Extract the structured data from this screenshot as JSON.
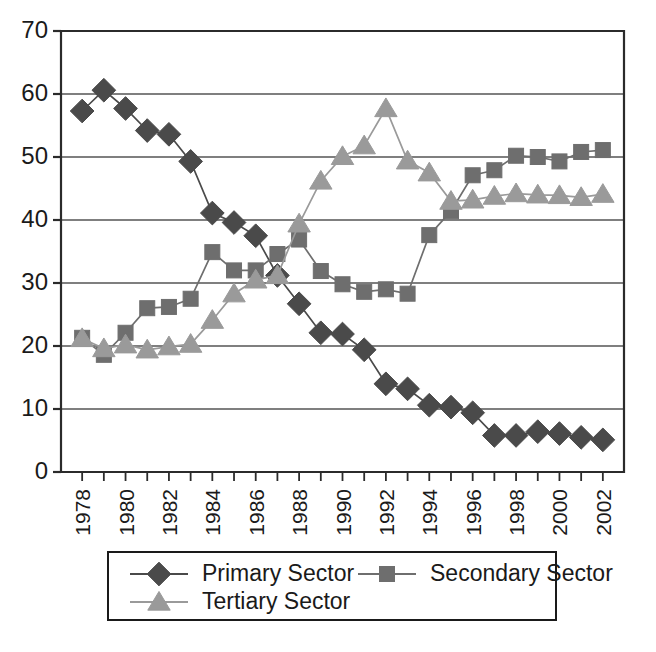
{
  "chart_data": {
    "type": "line",
    "title": "",
    "subtitle": "",
    "xlabel": "",
    "ylabel": "",
    "x": [
      1978,
      1979,
      1980,
      1981,
      1982,
      1983,
      1984,
      1985,
      1986,
      1987,
      1988,
      1989,
      1990,
      1991,
      1992,
      1993,
      1994,
      1995,
      1996,
      1997,
      1998,
      1999,
      2000,
      2001,
      2002
    ],
    "categories": [
      "1978",
      "1979",
      "1980",
      "1981",
      "1982",
      "1983",
      "1984",
      "1985",
      "1986",
      "1987",
      "1988",
      "1989",
      "1990",
      "1991",
      "1992",
      "1993",
      "1994",
      "1995",
      "1996",
      "1997",
      "1998",
      "1999",
      "2000",
      "2001",
      "2002"
    ],
    "xtick_labels": [
      "1978",
      "",
      "1980",
      "",
      "1982",
      "",
      "1984",
      "",
      "1986",
      "",
      "1988",
      "",
      "1990",
      "",
      "1992",
      "",
      "1994",
      "",
      "1996",
      "",
      "1998",
      "",
      "2000",
      "",
      "2002"
    ],
    "ytick_labels": [
      "0",
      "10",
      "20",
      "30",
      "40",
      "50",
      "60",
      "70"
    ],
    "yticks": [
      0,
      10,
      20,
      30,
      40,
      50,
      60,
      70
    ],
    "ylim": [
      0,
      70
    ],
    "xlim": [
      1977.5,
      2002.5
    ],
    "grid": "horizontal",
    "legend_position": "bottom",
    "series": [
      {
        "name": "Primary Sector",
        "marker": "diamond",
        "color": "#4a4a4a",
        "line_color": "#4a4a4a",
        "values": [
          57.3,
          60.6,
          57.7,
          54.2,
          53.6,
          49.3,
          41.1,
          39.6,
          37.5,
          31.2,
          26.7,
          22.1,
          21.9,
          19.4,
          14.0,
          13.2,
          10.6,
          10.3,
          9.4,
          5.8,
          5.8,
          6.4,
          6.1,
          5.5,
          5.1
        ]
      },
      {
        "name": "Secondary Sector",
        "marker": "square",
        "color": "#6e6e6e",
        "line_color": "#6e6e6e",
        "values": [
          21.3,
          18.6,
          22.1,
          26.0,
          26.2,
          27.5,
          34.9,
          32.0,
          32.0,
          34.6,
          36.9,
          31.9,
          29.8,
          28.6,
          29.0,
          28.3,
          37.6,
          41.4,
          47.1,
          47.9,
          50.2,
          50.0,
          49.3,
          50.8,
          51.1
        ]
      },
      {
        "name": "Tertiary Sector",
        "marker": "triangle",
        "color": "#9a9a9a",
        "line_color": "#9a9a9a",
        "values": [
          21.2,
          19.6,
          20.2,
          19.4,
          19.9,
          20.3,
          24.1,
          28.3,
          30.5,
          31.2,
          39.4,
          46.2,
          50.1,
          51.8,
          57.7,
          49.4,
          47.5,
          43.0,
          43.2,
          43.8,
          44.2,
          44.0,
          43.9,
          43.6,
          44.1
        ]
      }
    ]
  },
  "legend": {
    "items": [
      {
        "label": "Primary Sector",
        "marker": "diamond-marker-icon",
        "color": "#4a4a4a"
      },
      {
        "label": "Secondary Sector",
        "marker": "square-marker-icon",
        "color": "#6e6e6e"
      },
      {
        "label": "Tertiary Sector",
        "marker": "triangle-marker-icon",
        "color": "#9a9a9a"
      }
    ]
  },
  "axes": {
    "y_min_label": "0",
    "y_max_label": "70"
  }
}
